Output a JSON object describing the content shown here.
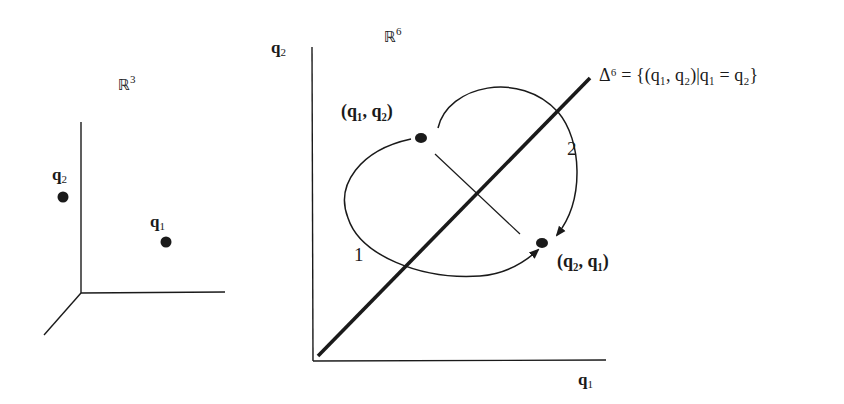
{
  "left_panel": {
    "space_label": "ℝ",
    "space_dim": "3",
    "points": [
      {
        "name": "q",
        "index": "2"
      },
      {
        "name": "q",
        "index": "1"
      }
    ]
  },
  "right_panel": {
    "space_label": "ℝ",
    "space_dim": "6",
    "y_axis": {
      "name": "q",
      "index": "2"
    },
    "x_axis": {
      "name": "q",
      "index": "1"
    },
    "point_a": "(q₁, q₂)",
    "point_b": "(q₂, q₁)",
    "path_1_label": "1",
    "path_2_label": "2",
    "diagonal_label": "Δ⁶ = {(q₁, q₂)|q₁ = q₂}"
  }
}
